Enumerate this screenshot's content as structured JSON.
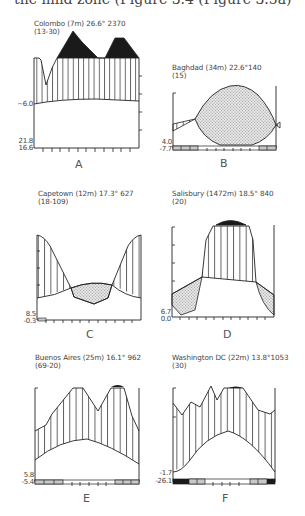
{
  "page": {
    "top_text": "the mild zone (Figure 3.4 (Figure 3.5a)",
    "top_text_visible_fragment": "the mild zone (Figure ..."
  },
  "patterns": {
    "hatch_color": "#333333",
    "stipple_color": "#bdbdbd",
    "black_fill": "#1a1a1a"
  },
  "diagrams": [
    {
      "id": "A",
      "label": "A",
      "station": "Colombo",
      "altitude": "(7m)",
      "mean_temp": "26.6°",
      "annual_precip": "2370",
      "years": "(13-30)",
      "title": "Colombo (7m) 26.6° 2370",
      "y_top_label": "~6.0",
      "y_bottom_labels": [
        "21.8",
        "16.6"
      ],
      "frost_months": []
    },
    {
      "id": "B",
      "label": "B",
      "station": "Baghdad",
      "altitude": "(34m)",
      "mean_temp": "22.6°",
      "annual_precip": "140",
      "years": "(15)",
      "title": "Baghdad (34m) 22.6°140",
      "y_top_label": "",
      "y_bottom_labels": [
        "4.0",
        "-7.7"
      ],
      "frost_months": [
        "Jan",
        "Feb",
        "Mar",
        "Nov",
        "Dec"
      ]
    },
    {
      "id": "C",
      "label": "C",
      "station": "Capetown",
      "altitude": "(12m)",
      "mean_temp": "17.3°",
      "annual_precip": "627",
      "years": "(18-109)",
      "title": "Capetown (12m) 17.3° 627",
      "y_top_label": "",
      "y_bottom_labels": [
        "8.5",
        "-0.3"
      ],
      "frost_months": [
        "Jan"
      ]
    },
    {
      "id": "D",
      "label": "D",
      "station": "Salisbury",
      "altitude": "(1472m)",
      "mean_temp": "18.5°",
      "annual_precip": "840",
      "years": "(20)",
      "title": "Salisbury (1472m) 18.5° 840",
      "y_top_label": "",
      "y_bottom_labels": [
        "6.7",
        "0.0"
      ],
      "frost_months": []
    },
    {
      "id": "E",
      "label": "E",
      "station": "Buenos Aires",
      "altitude": "(25m)",
      "mean_temp": "16.1°",
      "annual_precip": "962",
      "years": "(69-20)",
      "title": "Buenos Aires (25m) 16.1° 962",
      "y_top_label": "",
      "y_bottom_labels": [
        "5.8",
        "-5.4"
      ],
      "frost_months": [
        "Jan",
        "Feb",
        "Mar",
        "Oct",
        "Nov",
        "Dec"
      ]
    },
    {
      "id": "F",
      "label": "F",
      "station": "Washington DC",
      "altitude": "(22m)",
      "mean_temp": "13.8°",
      "annual_precip": "1053",
      "years": "(30)",
      "title": "Washington DC (22m) 13.8°1053",
      "y_top_label": "",
      "y_bottom_labels": [
        "-1.7",
        "-26.1"
      ],
      "frost_months": [
        "Jan",
        "Feb",
        "Mar",
        "Nov",
        "Dec"
      ]
    }
  ]
}
